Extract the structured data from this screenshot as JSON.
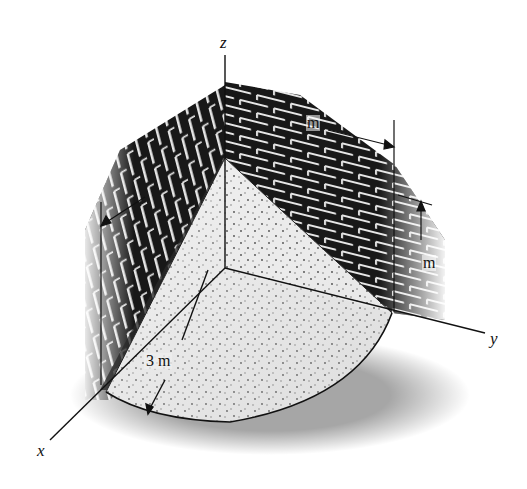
{
  "figure": {
    "axes": {
      "x_label": "x",
      "y_label": "y",
      "z_label": "z"
    },
    "dimensions": {
      "radius_label": "3 m",
      "top_length_label": "m",
      "right_height_label": "m"
    },
    "colors": {
      "brick": "#1a1a1a",
      "mortar": "#e8e8e8",
      "sand": "#ececec",
      "sand_dots": "#333333",
      "lines": "#111111",
      "background": "#ffffff"
    }
  }
}
